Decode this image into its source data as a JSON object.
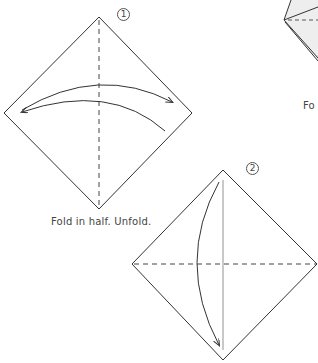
{
  "steps": [
    {
      "number": "1",
      "caption": "Fold in half. Unfold."
    },
    {
      "number": "2",
      "caption": ""
    }
  ],
  "partial_caption": "Fo",
  "colors": {
    "line": "#333333",
    "fill_partial": "#eeeeee"
  }
}
